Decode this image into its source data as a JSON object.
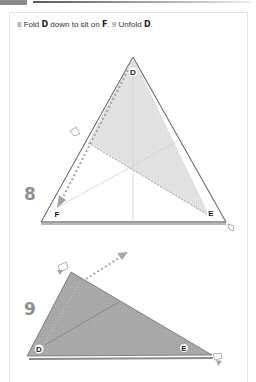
{
  "header": {
    "instruction": {
      "step8_num": "8",
      "step8_text_a": "Fold ",
      "step8_point_a": "D",
      "step8_text_b": " down to sit on ",
      "step8_point_b": "F",
      "step8_text_c": ". ",
      "step9_num": "9",
      "step9_text_a": " Unfold ",
      "step9_point_a": "D",
      "step9_text_b": "."
    }
  },
  "figures": {
    "step8": {
      "number": "8",
      "labels": {
        "top": "D",
        "left": "F",
        "right": "E"
      }
    },
    "step9": {
      "number": "9",
      "labels": {
        "left": "D",
        "right": "E"
      }
    }
  },
  "colors": {
    "paper_edge": "#7a7a7a",
    "shade_light": "#e2e2e2",
    "shade_dark": "#a9a9a9",
    "arrow": "#9c9c9c"
  }
}
